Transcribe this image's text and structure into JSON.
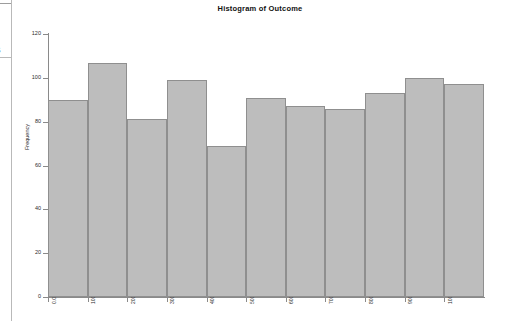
{
  "panel": {
    "clipped_glyph": "s"
  },
  "chart": {
    "title": "Histogram of Outcome",
    "ylabel": "Frequency",
    "y_ticks": [
      "0",
      "20",
      "40",
      "60",
      "80",
      "100",
      "120"
    ],
    "x_ticks": [
      "0.00",
      "100.00",
      "200.00",
      "300.00",
      "400.00",
      "500.00",
      "600.00",
      "700.00",
      "800.00",
      "900.00",
      "1000.00"
    ]
  },
  "chart_data": {
    "type": "bar",
    "title": "Histogram of Outcome",
    "xlabel": "",
    "ylabel": "Frequency",
    "ylim": [
      0,
      120
    ],
    "xlim": [
      0,
      1000
    ],
    "grid": false,
    "legend": "none",
    "bin_edges": [
      0,
      100,
      200,
      300,
      400,
      500,
      600,
      700,
      800,
      900,
      1000
    ],
    "bin_width": 100,
    "categories": [
      "0-100",
      "100-200",
      "200-300",
      "300-400",
      "400-500",
      "500-600",
      "600-700",
      "700-800",
      "800-900",
      "900-1000",
      "1000-1100"
    ],
    "values": [
      90,
      107,
      81,
      99,
      69,
      91,
      87,
      86,
      93,
      100,
      97
    ],
    "yticks": [
      0,
      20,
      40,
      60,
      80,
      100,
      120
    ],
    "xticks": [
      0,
      100,
      200,
      300,
      400,
      500,
      600,
      700,
      800,
      900,
      1000
    ],
    "xtick_labels": [
      "0.00",
      "100.00",
      "200.00",
      "300.00",
      "400.00",
      "500.00",
      "600.00",
      "700.00",
      "800.00",
      "900.00",
      "1000.00"
    ],
    "bar_color": "#bdbdbd",
    "bar_edge_color": "#8f8f8f"
  }
}
